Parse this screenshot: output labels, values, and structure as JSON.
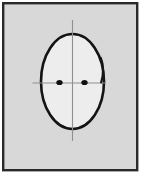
{
  "canvas": {
    "width": 147,
    "height": 181,
    "outer_background_color": "#ffffff",
    "panel_background_color": "#d8d8d8",
    "border_color": "#2a2a2a",
    "title": "Face sketch"
  },
  "figure": {
    "name": "head-face-sketch",
    "description": "Line drawing of a head: oval outline with two dot eyes, vertical and horizontal centerline guides, and a small curved contour on the right side",
    "stroke_color": "#141414",
    "face_fill_color": "#ededed",
    "guide_line_color": "#8f8f8f",
    "eye_color": "#101010"
  },
  "chart_data": {
    "type": "scatter",
    "xlabel": "",
    "ylabel": "",
    "xlim": [
      0,
      147
    ],
    "ylim": [
      181,
      0
    ],
    "grid": false,
    "legend": null,
    "annotations": [
      {
        "name": "panel-frame",
        "shape": "rect",
        "x": 2,
        "y": 2,
        "width": 136,
        "height": 169,
        "fill": "#d8d8d8",
        "stroke": "#2a2a2a",
        "stroke_width": 2.4
      },
      {
        "name": "head-oval",
        "shape": "ellipse",
        "cx": 72.5,
        "cy": 81.5,
        "rx": 31.5,
        "ry": 47.5,
        "fill": "#ededed",
        "stroke": "#141414",
        "stroke_width": 2.6
      },
      {
        "name": "vertical-guide",
        "shape": "line",
        "x1": 72.5,
        "y1": 20,
        "x2": 72.5,
        "y2": 141,
        "stroke": "#8f8f8f",
        "stroke_width": 1.1
      },
      {
        "name": "horizontal-guide",
        "shape": "line",
        "x1": 32.5,
        "y1": 83,
        "x2": 106,
        "y2": 83,
        "stroke": "#8f8f8f",
        "stroke_width": 1.1
      },
      {
        "name": "left-eye",
        "shape": "ellipse",
        "cx": 59.5,
        "cy": 82.5,
        "rx": 3.2,
        "ry": 2.6,
        "fill": "#101010"
      },
      {
        "name": "right-eye",
        "shape": "ellipse",
        "cx": 84.5,
        "cy": 82.5,
        "rx": 3.2,
        "ry": 2.6,
        "fill": "#101010"
      },
      {
        "name": "right-ear-contour",
        "shape": "path",
        "d": "M 100.8 58 C 103.4 64 103.6 74 101.2 82.4",
        "stroke": "#141414",
        "stroke_width": 2.2,
        "fill": "none"
      }
    ],
    "points": [
      {
        "name": "left-eye",
        "x": 59.5,
        "y": 82.5
      },
      {
        "name": "right-eye",
        "x": 84.5,
        "y": 82.5
      }
    ]
  }
}
